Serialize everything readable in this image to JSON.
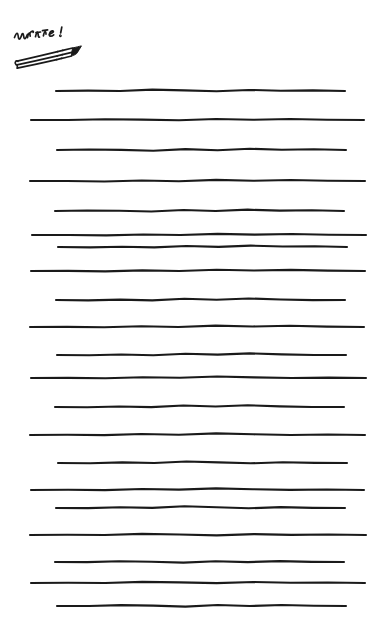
{
  "page": {
    "width": 387,
    "height": 626,
    "background_color": "#ffffff",
    "ink_color": "#1a1a1a"
  },
  "header": {
    "word_text": "write!",
    "word_style": "handwritten-cursive",
    "word_icon": "handwritten-write-word",
    "pencil_icon": "pencil-icon",
    "pencil_description": "hand-drawn hexagonal pencil tilted up to the right with dark shaded tip"
  },
  "ruled_lines": {
    "count": 18,
    "stroke_color": "#1a1a1a",
    "stroke_width": 2.1,
    "style": "hand-drawn wavy horizontal rule",
    "items": [
      {
        "index": 1,
        "y": 91,
        "x_start": 56,
        "x_end": 345,
        "wobble": 1.2
      },
      {
        "index": 2,
        "y": 120,
        "x_start": 31,
        "x_end": 364,
        "wobble": 1.0
      },
      {
        "index": 3,
        "y": 150,
        "x_start": 57,
        "x_end": 346,
        "wobble": 1.4
      },
      {
        "index": 4,
        "y": 181,
        "x_start": 30,
        "x_end": 365,
        "wobble": 1.1
      },
      {
        "index": 5,
        "y": 211,
        "x_start": 55,
        "x_end": 344,
        "wobble": 1.3
      },
      {
        "index": 6,
        "y": 235,
        "x_start": 32,
        "x_end": 366,
        "wobble": 0.9
      },
      {
        "index": 7,
        "y": 247,
        "x_start": 58,
        "x_end": 347,
        "wobble": 1.2
      },
      {
        "index": 8,
        "y": 271,
        "x_start": 31,
        "x_end": 365,
        "wobble": 1.0
      },
      {
        "index": 9,
        "y": 300,
        "x_start": 56,
        "x_end": 345,
        "wobble": 1.3
      },
      {
        "index": 10,
        "y": 327,
        "x_start": 30,
        "x_end": 364,
        "wobble": 1.1
      },
      {
        "index": 11,
        "y": 355,
        "x_start": 57,
        "x_end": 346,
        "wobble": 1.2
      },
      {
        "index": 12,
        "y": 378,
        "x_start": 31,
        "x_end": 366,
        "wobble": 1.0
      },
      {
        "index": 13,
        "y": 407,
        "x_start": 55,
        "x_end": 344,
        "wobble": 1.3
      },
      {
        "index": 14,
        "y": 435,
        "x_start": 30,
        "x_end": 365,
        "wobble": 1.1
      },
      {
        "index": 15,
        "y": 463,
        "x_start": 58,
        "x_end": 347,
        "wobble": 1.2
      },
      {
        "index": 16,
        "y": 490,
        "x_start": 31,
        "x_end": 364,
        "wobble": 1.0
      },
      {
        "index": 17,
        "y": 508,
        "x_start": 56,
        "x_end": 345,
        "wobble": 1.3
      },
      {
        "index": 18,
        "y": 535,
        "x_start": 30,
        "x_end": 366,
        "wobble": 1.1
      },
      {
        "index": 19,
        "y": 562,
        "x_start": 55,
        "x_end": 344,
        "wobble": 1.2
      },
      {
        "index": 20,
        "y": 583,
        "x_start": 31,
        "x_end": 365,
        "wobble": 1.0
      },
      {
        "index": 21,
        "y": 606,
        "x_start": 57,
        "x_end": 346,
        "wobble": 1.3
      }
    ]
  }
}
